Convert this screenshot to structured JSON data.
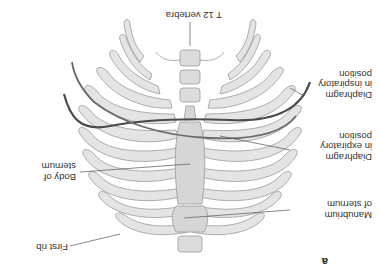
{
  "figure": {
    "panel_letter": "a",
    "orientation": "rotated-180",
    "colors": {
      "bone_fill": "#e4e4e4",
      "bone_stroke": "#9a9a9a",
      "cartilage_fill": "#cfcfcf",
      "diaphragm_inspiratory": "#4a4a4a",
      "diaphragm_expiratory": "#6a6a6a",
      "leader_line": "#555555",
      "label_text": "#333333"
    },
    "labels": {
      "t12": "T 12 vertebra",
      "first_rib": "First rib",
      "manubrium": "Manubrium\nof sternum",
      "body_sternum": "Body of\nsternum",
      "diaphragm_exp": "Diaphragm\nin expiratory\nposition",
      "diaphragm_insp": "Diaphragm\nin inspiratory\nposition"
    }
  }
}
